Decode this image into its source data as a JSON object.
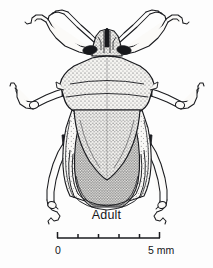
{
  "figure": {
    "domain": "scientific-illustration",
    "caption": "Adult",
    "background_color": "#fdfdfd",
    "ink_color": "#1a1b1f",
    "fill_color": "#f4f3f0",
    "stipple_color": "#2a2b30"
  },
  "scale_bar": {
    "min_label": "0",
    "max_label": "5 mm",
    "units": "mm",
    "min_value": 0,
    "max_value": 5,
    "divisions": 5,
    "tick_count": 6,
    "bar_left_px": 57,
    "bar_right_px": 160,
    "bar_y_px": 238,
    "line_color": "#1a1b1f"
  },
  "anatomy": {
    "head": "head-with-tylus",
    "eyes": "compound-eye",
    "antennae": "antenna-segmented",
    "pronotum": "pronotum-shield",
    "scutellum": "scutellum-triangle",
    "hemelytra": "hemelytron-wing",
    "membrane": "wing-membrane",
    "abdomen": "abdomen-connexivum",
    "legs": "leg-femur-tibia-tarsus"
  }
}
